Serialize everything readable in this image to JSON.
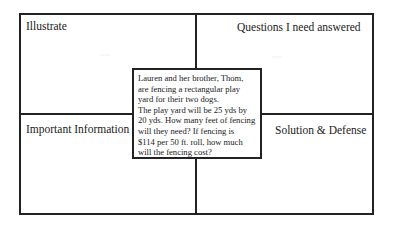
{
  "quadrants": {
    "top_left": "Illustrate",
    "top_right": "Questions I need answered",
    "bottom_left": "Important Information",
    "bottom_right": "Solution & Defense"
  },
  "watermarks": {
    "left": "~~~",
    "right": "~~~"
  },
  "problem": {
    "lines": [
      "Lauren and her brother, Thom,",
      "are fencing a rectangular play",
      "yard for their two dogs.",
      "The play yard will be 25 yds by",
      "20 yds. How many feet of fencing",
      "will they need? If fencing is",
      "$114 per 50 ft. roll, how much",
      "will the fencing cost?"
    ]
  }
}
